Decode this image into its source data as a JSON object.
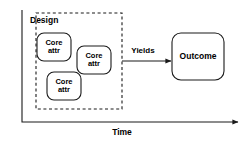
{
  "diagram": {
    "colors": {
      "stroke": "#1a1a1a",
      "text": "#000000",
      "background": "#ffffff"
    },
    "design_group": {
      "label": "Design",
      "border_style": "dashed"
    },
    "core_attributes": [
      {
        "line1": "Core",
        "line2": "attr"
      },
      {
        "line1": "Core",
        "line2": "attr"
      },
      {
        "line1": "Core",
        "line2": "attr"
      }
    ],
    "connector": {
      "label": "Yields",
      "arrowhead": "solid-triangle"
    },
    "outcome": {
      "label": "Outcome"
    },
    "axis": {
      "label": "Time",
      "orientation": "horizontal",
      "arrowhead": "solid-triangle"
    }
  }
}
